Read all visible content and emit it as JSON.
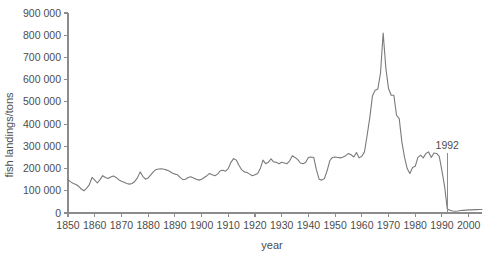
{
  "chart_data": {
    "type": "line",
    "title": "",
    "subtitle": "",
    "xlabel": "year",
    "ylabel": "fish landings/tons",
    "xlim": [
      1850,
      2005
    ],
    "ylim": [
      0,
      900000
    ],
    "grid": false,
    "legend": null,
    "xticks": [
      1850,
      1860,
      1870,
      1880,
      1890,
      1900,
      1910,
      1920,
      1930,
      1940,
      1950,
      1960,
      1970,
      1980,
      1990,
      2000
    ],
    "xtick_labels": [
      "1850",
      "1860",
      "1870",
      "1880",
      "1890",
      "1900",
      "1910",
      "1920",
      "1930",
      "1940",
      "1950",
      "1960",
      "1970",
      "1980",
      "1990",
      "2000"
    ],
    "yticks": [
      0,
      100000,
      200000,
      300000,
      400000,
      500000,
      600000,
      700000,
      800000,
      900000
    ],
    "ytick_labels": [
      "0",
      "100 000",
      "200 000",
      "300 000",
      "400 000",
      "500 000",
      "600 000",
      "700 000",
      "800 000",
      "900 000"
    ],
    "line_color": "#7a7a7a",
    "axis_color": "#8c8c8c",
    "text_color": "#4d4d4d",
    "background_color": "#ffffff",
    "annotations": [
      {
        "label": "1992",
        "x": 1992,
        "y_text": 270000,
        "type": "vertical-line-with-label"
      }
    ],
    "series": [
      {
        "name": "fish landings",
        "x": [
          1850,
          1851,
          1852,
          1853,
          1854,
          1855,
          1856,
          1857,
          1858,
          1859,
          1860,
          1861,
          1862,
          1863,
          1864,
          1865,
          1866,
          1867,
          1868,
          1869,
          1870,
          1871,
          1872,
          1873,
          1874,
          1875,
          1876,
          1877,
          1878,
          1879,
          1880,
          1881,
          1882,
          1883,
          1884,
          1885,
          1886,
          1887,
          1888,
          1889,
          1890,
          1891,
          1892,
          1893,
          1894,
          1895,
          1896,
          1897,
          1898,
          1899,
          1900,
          1901,
          1902,
          1903,
          1904,
          1905,
          1906,
          1907,
          1908,
          1909,
          1910,
          1911,
          1912,
          1913,
          1914,
          1915,
          1916,
          1917,
          1918,
          1919,
          1920,
          1921,
          1922,
          1923,
          1924,
          1925,
          1926,
          1927,
          1928,
          1929,
          1930,
          1931,
          1932,
          1933,
          1934,
          1935,
          1936,
          1937,
          1938,
          1939,
          1940,
          1941,
          1942,
          1943,
          1944,
          1945,
          1946,
          1947,
          1948,
          1949,
          1950,
          1951,
          1952,
          1953,
          1954,
          1955,
          1956,
          1957,
          1958,
          1959,
          1960,
          1961,
          1962,
          1963,
          1964,
          1965,
          1966,
          1967,
          1968,
          1969,
          1970,
          1971,
          1972,
          1973,
          1974,
          1975,
          1976,
          1977,
          1978,
          1979,
          1980,
          1981,
          1982,
          1983,
          1984,
          1985,
          1986,
          1987,
          1988,
          1989,
          1990,
          1991,
          1992,
          1993,
          1994,
          1995,
          1996,
          1997,
          1998,
          1999,
          2000,
          2001,
          2002,
          2003,
          2004,
          2005
        ],
        "values": [
          150000,
          140000,
          133000,
          128000,
          120000,
          108000,
          100000,
          112000,
          128000,
          160000,
          148000,
          135000,
          150000,
          168000,
          160000,
          155000,
          162000,
          167000,
          160000,
          150000,
          143000,
          138000,
          133000,
          130000,
          133000,
          142000,
          158000,
          185000,
          165000,
          152000,
          158000,
          172000,
          186000,
          196000,
          198000,
          199000,
          197000,
          193000,
          188000,
          180000,
          175000,
          172000,
          160000,
          150000,
          152000,
          160000,
          163000,
          158000,
          152000,
          148000,
          152000,
          160000,
          168000,
          178000,
          172000,
          168000,
          175000,
          190000,
          192000,
          188000,
          200000,
          228000,
          245000,
          238000,
          215000,
          195000,
          185000,
          182000,
          175000,
          168000,
          172000,
          178000,
          200000,
          238000,
          222000,
          228000,
          244000,
          230000,
          228000,
          222000,
          228000,
          225000,
          222000,
          235000,
          258000,
          250000,
          240000,
          225000,
          222000,
          228000,
          250000,
          252000,
          250000,
          195000,
          152000,
          148000,
          155000,
          190000,
          235000,
          250000,
          252000,
          250000,
          248000,
          252000,
          258000,
          268000,
          262000,
          252000,
          272000,
          248000,
          255000,
          275000,
          350000,
          430000,
          528000,
          552000,
          558000,
          630000,
          810000,
          652000,
          560000,
          530000,
          530000,
          440000,
          425000,
          320000,
          250000,
          200000,
          178000,
          205000,
          210000,
          250000,
          260000,
          248000,
          268000,
          275000,
          250000,
          270000,
          268000,
          255000,
          190000,
          120000,
          18000,
          12000,
          9000,
          8000,
          9000,
          11000,
          12000,
          13000,
          14000,
          14000,
          15000,
          15000,
          16000,
          16000
        ]
      }
    ]
  }
}
